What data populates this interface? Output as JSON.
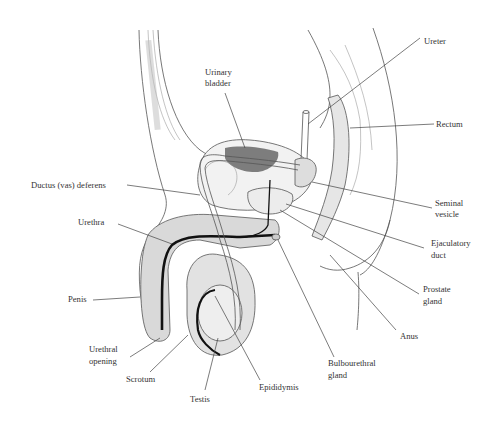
{
  "diagram": {
    "labels": [
      {
        "id": "ureter",
        "lines": [
          "Ureter"
        ]
      },
      {
        "id": "urinary-bladder",
        "lines": [
          "Urinary",
          "bladder"
        ]
      },
      {
        "id": "rectum",
        "lines": [
          "Rectum"
        ]
      },
      {
        "id": "ductus-deferens",
        "lines": [
          "Ductus (vas) deferens"
        ]
      },
      {
        "id": "seminal-vesicle",
        "lines": [
          "Seminal",
          "vesicle"
        ]
      },
      {
        "id": "urethra",
        "lines": [
          "Urethra"
        ]
      },
      {
        "id": "ejaculatory-duct",
        "lines": [
          "Ejaculatory",
          "duct"
        ]
      },
      {
        "id": "prostate-gland",
        "lines": [
          "Prostate",
          "gland"
        ]
      },
      {
        "id": "penis",
        "lines": [
          "Penis"
        ]
      },
      {
        "id": "anus",
        "lines": [
          "Anus"
        ]
      },
      {
        "id": "urethral-opening",
        "lines": [
          "Urethral",
          "opening"
        ]
      },
      {
        "id": "bulbourethral-gland",
        "lines": [
          "Bulbourethral",
          "gland"
        ]
      },
      {
        "id": "scrotum",
        "lines": [
          "Scrotum"
        ]
      },
      {
        "id": "epididymis",
        "lines": [
          "Epididymis"
        ]
      },
      {
        "id": "testis",
        "lines": [
          "Testis"
        ]
      }
    ]
  }
}
